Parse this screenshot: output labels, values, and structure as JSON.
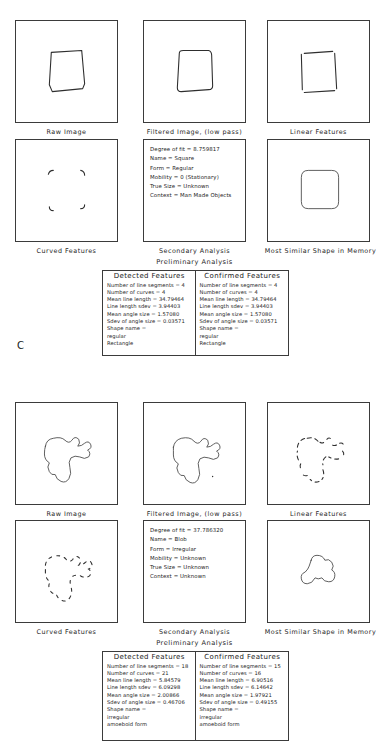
{
  "figure": {
    "letter": "C"
  },
  "panels": [
    {
      "id": "square",
      "captions": {
        "raw_image": "Raw Image",
        "filtered_image": "Filtered Image, (low pass)",
        "linear_features": "Linear Features",
        "curved_features": "Curved Features",
        "secondary_analysis": "Secondary Analysis",
        "most_similar_shape": "Most Similar Shape in Memory",
        "preliminary_analysis": "Preliminary Analysis"
      },
      "secondary_analysis": {
        "lines": [
          "Degree of fit = 8.759817",
          "Name = Square",
          "Form = Regular",
          "Mobility = 0 (Stationary)",
          "True Size = Unknown",
          "Context = Man Made Objects"
        ]
      },
      "features_table": {
        "columns": [
          {
            "header": "Detected Features",
            "lines": [
              "Number of line segments = 4",
              "Number of curves = 4",
              "Mean line length = 34.79464",
              "Line length sdev = 3.94403",
              "Mean angle size = 1.57080",
              "Sdev of angle size = 0.03571",
              "Shape name =",
              "regular",
              "Rectangle"
            ]
          },
          {
            "header": "Confirmed Features",
            "lines": [
              "Number of line segments = 4",
              "Number of curves = 4",
              "Mean line length = 34.79464",
              "Line length sdev = 3.94403",
              "Mean angle size = 1.57080",
              "Sdev of angle size = 0.03571",
              "Shape name =",
              "regular",
              "Rectangle"
            ]
          }
        ]
      }
    },
    {
      "id": "blob",
      "captions": {
        "raw_image": "Raw Image",
        "filtered_image": "Filtered Image, (low pass)",
        "linear_features": "Linear Features",
        "curved_features": "Curved Features",
        "secondary_analysis": "Secondary Analysis",
        "most_similar_shape": "Most Similar Shape in Memory",
        "preliminary_analysis": "Preliminary Analysis"
      },
      "secondary_analysis": {
        "lines": [
          "Degree of fit = 37.786320",
          "Name = Blob",
          "Form = Irregular",
          "Mobility = Unknown",
          "True Size = Unknown",
          "Context = Unknown"
        ]
      },
      "features_table": {
        "columns": [
          {
            "header": "Detected Features",
            "lines": [
              "Number of line segments = 18",
              "Number of curves = 21",
              "Mean line length = 5.84579",
              "Line length sdev = 6.09298",
              "Mean angle size = 2.00866",
              "Sdev of angle size = 0.46706",
              "Shape name =",
              "irregular",
              "amoeboid form"
            ]
          },
          {
            "header": "Confirmed Features",
            "lines": [
              "Number of line segments = 15",
              "Number of curves = 16",
              "Mean line length = 6.90516",
              "Line length sdev = 6.14642",
              "Mean angle size = 1.97921",
              "Sdev of angle size = 0.49155",
              "Shape name =",
              "irregular",
              "amoeboid form"
            ]
          }
        ]
      }
    }
  ]
}
